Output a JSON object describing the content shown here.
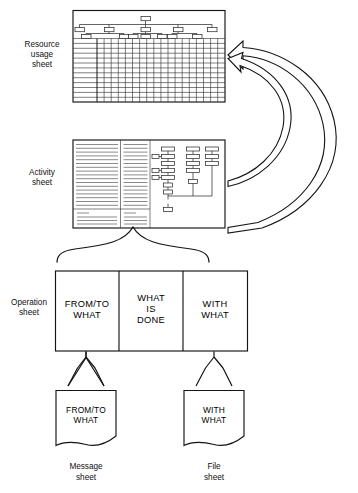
{
  "diagram": {
    "background_color": "#ffffff",
    "line_color": "#141414",
    "labels": {
      "resource_sheet": [
        "Resource",
        "usage",
        "sheet"
      ],
      "activity_sheet": [
        "Activity",
        "sheet"
      ],
      "operation_sheet": [
        "Operation",
        "sheet"
      ],
      "message_sheet": [
        "Message",
        "sheet"
      ],
      "file_sheet": [
        "File",
        "sheet"
      ]
    },
    "resource_usage_sheet": {
      "name": "Resource usage sheet",
      "header_kind": "org-tree",
      "tree_levels": 3,
      "grid_rows": 13,
      "grid_columns": 18
    },
    "activity_sheet": {
      "name": "Activity sheet",
      "left_column_rules": 17,
      "middle_column_rules": 17,
      "footer_rules": 4,
      "flow_chains": 3,
      "flow_nodes_total": 16
    },
    "operation_sheet": {
      "name": "Operation sheet",
      "cells": [
        {
          "id": "from-to-what",
          "lines": [
            "FROM/TO",
            "WHAT"
          ]
        },
        {
          "id": "what-is-done",
          "lines": [
            "WHAT",
            "IS",
            "DONE"
          ]
        },
        {
          "id": "with-what",
          "lines": [
            "WITH",
            "WHAT"
          ]
        }
      ]
    },
    "message_sheet": {
      "name": "Message sheet",
      "lines": [
        "FROM/TO",
        "WHAT"
      ],
      "caption": [
        "Message",
        "sheet"
      ]
    },
    "file_sheet": {
      "name": "File sheet",
      "lines": [
        "WITH",
        "WHAT"
      ],
      "caption": [
        "File",
        "sheet"
      ]
    },
    "connectors": {
      "feedback_arrow_upper": "activity sheet to resource usage sheet",
      "feedback_arrow_lower": "activity sheet bottom to resource usage sheet",
      "brace": "activity sheet to operation sheet",
      "chevron_left": "message sheet to operation sheet FROM/TO WHAT",
      "chevron_right": "file sheet to operation sheet WITH WHAT"
    }
  }
}
